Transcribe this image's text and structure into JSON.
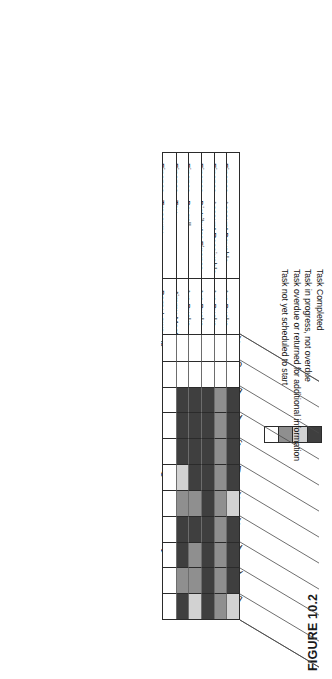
{
  "figure": {
    "caption": "FIGURE 10.2",
    "corner_label_department": "Department",
    "corner_label_manager": "Department Manager"
  },
  "legend": {
    "items": [
      {
        "label": "Task Completed",
        "color": "#3f3f3f"
      },
      {
        "label": "Task in progress, not overdue",
        "color": "#d2d2d2"
      },
      {
        "label": "Task overdue or returned for additional information",
        "color": "#8f8f8f"
      },
      {
        "label": "Task not yet scheduled to start",
        "color": "#ffffff"
      }
    ]
  },
  "chart_data": {
    "type": "heatmap",
    "title": "FIGURE 10.2",
    "xlabel": "Department",
    "ylabel": "",
    "grid": true,
    "legend_position": "right",
    "row_header_label": "Department",
    "manager_header_label": "Department Manager",
    "value_scale": {
      "completed": "#3f3f3f",
      "in_progress": "#d2d2d2",
      "overdue": "#8f8f8f",
      "not_started": "#ffffff"
    },
    "categories": [
      "Finance - Account Payable",
      "Finance - Account Receivable",
      "Finance - Distributor Finance",
      "Finance - Payroll",
      "Finance - Tax",
      "Finance - Treasury"
    ],
    "managers": [
      "Iva Bucks",
      "Iva Bucks",
      "Iva Bucks",
      "Iva Bucks",
      "Jimmy Most",
      "Barry Lowe"
    ],
    "tasks": [
      "Team Employees",
      "Contacts and Vendors",
      "Equipment Requirements",
      "Forms and Supplies",
      "Software Requirements",
      "Vital Records",
      "Team Tasks",
      "Team and Alternate Lead",
      "Plan Overview",
      "Alternate Location",
      "Draft Plan Submitted for Review",
      "Corrected draft and Sign off",
      "Final Submitted"
    ],
    "task_columns": [
      "Team Employees",
      "Contacts and Vendors",
      "Equipment Requirements",
      "Forms and Supplies",
      "Software Requirements",
      "Vital Records",
      "Team Tasks",
      "Team and Alternate Lead",
      "Plan Overview",
      "Alternate Location",
      "Draft Plan Submitted for Review",
      "Corrected draft and Sign off",
      "Final Submitted"
    ],
    "cells": [
      {
        "department": "Finance - Account Payable",
        "statuses": [
          "in_progress",
          "completed",
          "completed",
          "completed",
          "in_progress",
          "completed",
          "completed",
          "completed",
          "completed",
          "not_started",
          "not_started"
        ]
      },
      {
        "department": "Finance - Account Receivable",
        "statuses": [
          "overdue",
          "overdue",
          "overdue",
          "overdue",
          "overdue",
          "overdue",
          "overdue",
          "overdue",
          "overdue",
          "not_started",
          "not_started"
        ]
      },
      {
        "department": "Finance - Distributor Finance",
        "statuses": [
          "completed",
          "completed",
          "completed",
          "completed",
          "completed",
          "completed",
          "completed",
          "completed",
          "completed",
          "not_started",
          "not_started"
        ]
      },
      {
        "department": "Finance - Payroll",
        "statuses": [
          "in_progress",
          "overdue",
          "overdue",
          "completed",
          "overdue",
          "completed",
          "completed",
          "completed",
          "completed",
          "not_started",
          "not_started"
        ]
      },
      {
        "department": "Finance - Tax",
        "statuses": [
          "completed",
          "overdue",
          "completed",
          "completed",
          "overdue",
          "in_progress",
          "completed",
          "completed",
          "completed",
          "not_started",
          "not_started"
        ]
      },
      {
        "department": "Finance - Treasury",
        "statuses": [
          "not_started",
          "not_started",
          "not_started",
          "not_started",
          "not_started",
          "not_started",
          "not_started",
          "not_started",
          "not_started",
          "not_started",
          "not_started"
        ]
      }
    ]
  }
}
